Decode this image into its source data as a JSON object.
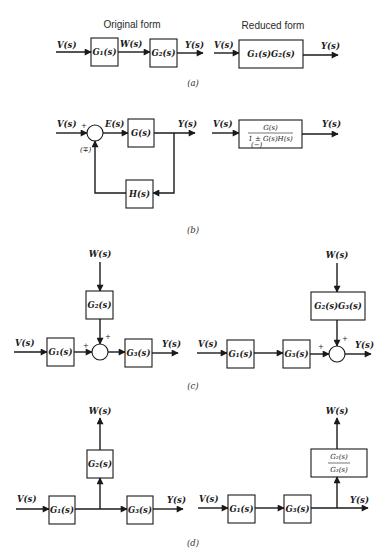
{
  "headers": {
    "original": "Original form",
    "reduced": "Reduced form"
  },
  "captions": {
    "a": "(a)",
    "b": "(b)",
    "c": "(c)",
    "d": "(d)"
  },
  "a": {
    "original": {
      "input": "V(s)",
      "block1": "G₁(s)",
      "mid": "W(s)",
      "block2": "G₂(s)",
      "output": "Y(s)"
    },
    "reduced": {
      "input": "V(s)",
      "block": "G₁(s)G₂(s)",
      "output": "Y(s)"
    }
  },
  "b": {
    "original": {
      "input": "V(s)",
      "plus": "+",
      "feedback_sign": "(∓)",
      "error": "E(s)",
      "forward": "G(s)",
      "output": "Y(s)",
      "feedback": "H(s)"
    },
    "reduced": {
      "input": "V(s)",
      "numerator": "G(s)",
      "denominator": "1 ± G(s)H(s)",
      "denominator_sign_note": "(−)",
      "output": "Y(s)"
    }
  },
  "c": {
    "original": {
      "input": "V(s)",
      "disturbance": "W(s)",
      "block1": "G₁(s)",
      "block2": "G₂(s)",
      "block3": "G₃(s)",
      "plus_left": "+",
      "plus_top": "+",
      "output": "Y(s)"
    },
    "reduced": {
      "input": "V(s)",
      "disturbance": "W(s)",
      "block1": "G₁(s)",
      "block3": "G₃(s)",
      "block23": "G₂(s)G₃(s)",
      "plus_left": "+",
      "plus_top": "+",
      "output": "Y(s)"
    }
  },
  "d": {
    "original": {
      "input": "V(s)",
      "branch_output": "W(s)",
      "block1": "G₁(s)",
      "block2": "G₂(s)",
      "block3": "G₃(s)",
      "output": "Y(s)"
    },
    "reduced": {
      "input": "V(s)",
      "branch_output": "W(s)",
      "block1": "G₁(s)",
      "block3": "G₃(s)",
      "ratio_num": "G₂(s)",
      "ratio_den": "G₃(s)",
      "output": "Y(s)"
    }
  }
}
